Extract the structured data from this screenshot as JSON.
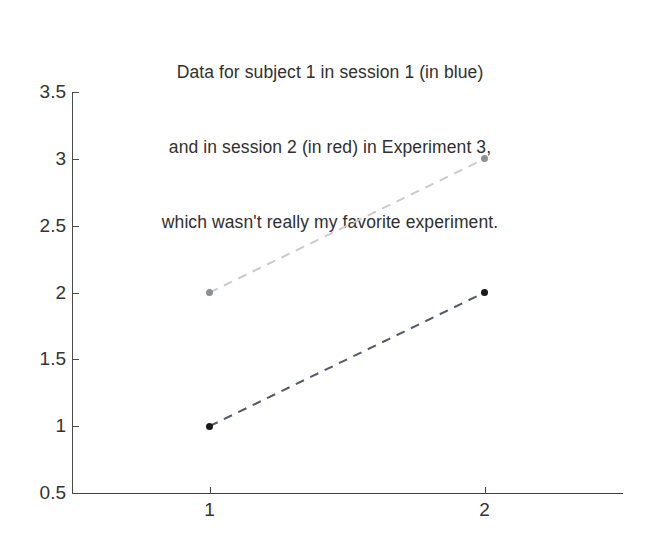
{
  "chart_data": {
    "type": "line",
    "title": "Data for subject 1 in session 1 (in blue)\nand in session 2 (in red) in Experiment 3,\nwhich wasn't really my favorite experiment.",
    "title_lines": [
      "Data for subject 1 in session 1 (in blue)",
      "and in session 2 (in red) in Experiment 3,",
      "which wasn't really my favorite experiment."
    ],
    "xlabel": "",
    "ylabel": "",
    "x": [
      1,
      2
    ],
    "xlim": [
      0.5,
      2.5
    ],
    "ylim": [
      0.5,
      3.5
    ],
    "xticks": [
      1,
      2
    ],
    "xticklabels": [
      "1",
      "2"
    ],
    "yticks": [
      0.5,
      1,
      1.5,
      2,
      2.5,
      3,
      3.5
    ],
    "yticklabels": [
      "0.5",
      "1",
      "1.5",
      "2",
      "2.5",
      "3",
      "3.5"
    ],
    "grid": false,
    "legend": false,
    "legend_position": "none",
    "linestyle": "dashed",
    "marker": "circle",
    "series": [
      {
        "name": "session 1",
        "label": "session 1 (in blue)",
        "values": [
          1,
          2
        ],
        "color": "#555a66",
        "marker_color": "#1a1a1a"
      },
      {
        "name": "session 2",
        "label": "session 2 (in red)",
        "values": [
          2,
          3
        ],
        "color": "#c9cbd0",
        "marker_color": "#8d8f94"
      }
    ]
  },
  "axes": {
    "y_axis_name": "value-axis",
    "x_axis_name": "condition-axis"
  }
}
